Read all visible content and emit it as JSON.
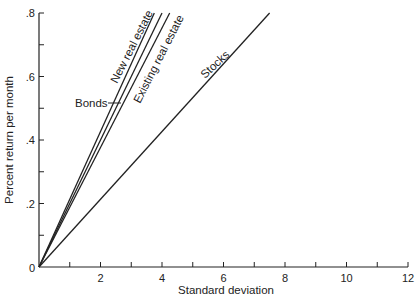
{
  "chart_data": {
    "type": "line",
    "title": "",
    "xlabel": "Standard deviation",
    "ylabel": "Percent return per month",
    "xlim": [
      0,
      12
    ],
    "ylim": [
      0,
      0.8
    ],
    "grid": false,
    "legend": "inline labels on lines",
    "x_ticks": [
      0,
      1,
      2,
      3,
      4,
      5,
      6,
      7,
      8,
      9,
      10,
      11,
      12
    ],
    "x_tick_labels": [
      "",
      "",
      "2",
      "",
      "4",
      "",
      "6",
      "",
      "8",
      "",
      "10",
      "",
      "12"
    ],
    "y_ticks": [
      0,
      0.1,
      0.2,
      0.3,
      0.4,
      0.5,
      0.6,
      0.7,
      0.8
    ],
    "y_tick_labels": [
      "0",
      "",
      ".2",
      "",
      ".4",
      "",
      ".6",
      "",
      ".8"
    ],
    "series": [
      {
        "name": "New real estate",
        "x": [
          0,
          3.75
        ],
        "y": [
          0,
          0.8
        ]
      },
      {
        "name": "Bonds",
        "x": [
          0,
          4.0
        ],
        "y": [
          0,
          0.8
        ]
      },
      {
        "name": "Existing real estate",
        "x": [
          0,
          4.25
        ],
        "y": [
          0,
          0.8
        ]
      },
      {
        "name": "Stocks",
        "x": [
          0,
          7.5
        ],
        "y": [
          0,
          0.8
        ]
      }
    ]
  },
  "labels": {
    "x_axis_title": "Standard deviation",
    "y_axis_title": "Percent return per month",
    "origin": "0",
    "new_real_estate": "New real estate",
    "bonds": "Bonds",
    "existing_real_estate": "Existing real estate",
    "stocks": "Stocks"
  }
}
